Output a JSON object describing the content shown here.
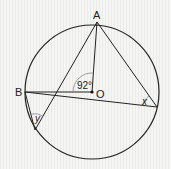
{
  "diagram": {
    "type": "circle-geometry",
    "points": {
      "A": {
        "label": "A",
        "x": 97,
        "y": 22
      },
      "O": {
        "label": "O",
        "x": 92,
        "y": 92
      },
      "B": {
        "label": "B",
        "x": 25,
        "y": 92
      },
      "C": {
        "label": "",
        "x": 157,
        "y": 107
      },
      "D": {
        "label": "",
        "x": 35,
        "y": 130
      }
    },
    "circle": {
      "cx": 92,
      "cy": 92,
      "r": 67
    },
    "angles": {
      "AOB": {
        "label": "92°"
      },
      "x": {
        "label": "x"
      },
      "y": {
        "label": "y"
      }
    }
  }
}
